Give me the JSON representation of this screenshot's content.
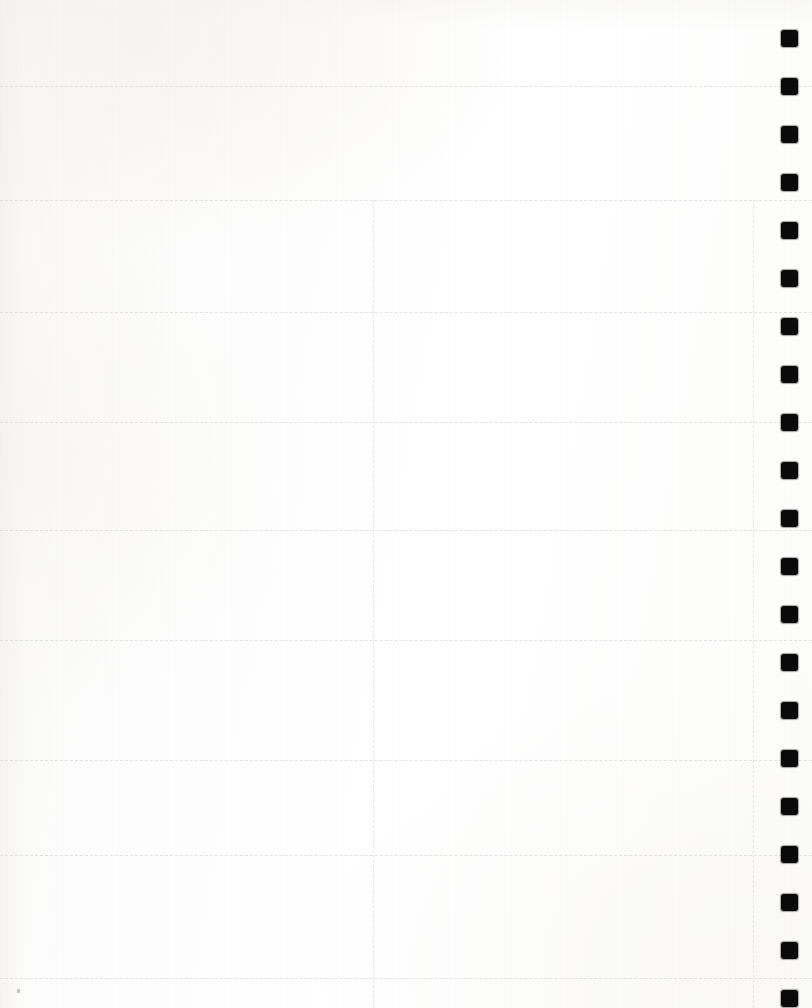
{
  "page": {
    "kind": "scanned-blank-planner-page",
    "width": 812,
    "height": 1008,
    "paper_color": "#fdfdfd",
    "paper_warm_tint": "#f8f7f5",
    "has_visible_text": false,
    "text_content": ""
  },
  "grid": {
    "rule_color": "#dedede",
    "rule_style": "dashed",
    "horizontal_rules_y": [
      86,
      200,
      312,
      422,
      530,
      640,
      760,
      855,
      978
    ],
    "vertical_rules": [
      {
        "name": "column-divider-left",
        "x": 373,
        "y_start": 200,
        "y_end": 1008
      },
      {
        "name": "column-divider-right",
        "x": 753,
        "y_start": 200,
        "y_end": 1008
      }
    ]
  },
  "punch_holes": {
    "color": "#0a0a0a",
    "x": 781,
    "size": 17,
    "spacing": 48,
    "first_center_y": 38,
    "count": 21,
    "centers_y": [
      38,
      86,
      134,
      182,
      230,
      278,
      326,
      374,
      422,
      470,
      518,
      566,
      614,
      662,
      710,
      758,
      806,
      854,
      902,
      950,
      998
    ]
  },
  "artifacts": {
    "specks": [
      {
        "name": "scan-speck-bottom-left",
        "x": 17,
        "y": 989
      }
    ]
  }
}
